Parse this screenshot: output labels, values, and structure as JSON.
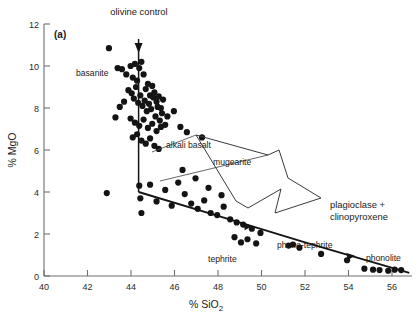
{
  "figure": {
    "panel_label": "(a)",
    "background": "#ffffff",
    "point_color": "#141414",
    "axis_color": "#6f6f6f"
  },
  "chart_data": {
    "type": "scatter",
    "title": "",
    "xlabel": "% SiO2",
    "xlabel_main": "% SiO",
    "xlabel_sub": "2",
    "ylabel": "% MgO",
    "xlim": [
      40,
      57
    ],
    "ylim": [
      0,
      12
    ],
    "xticks": [
      40,
      42,
      44,
      46,
      48,
      50,
      52,
      54,
      56
    ],
    "yticks": [
      0,
      2,
      4,
      6,
      8,
      10,
      12
    ],
    "grid": false,
    "legend": "none",
    "x": [
      43.0,
      43.4,
      43.6,
      43.8,
      44.0,
      44.1,
      44.2,
      44.3,
      44.4,
      44.5,
      44.6,
      44.7,
      44.8,
      44.9,
      45.0,
      45.1,
      45.2,
      45.3,
      45.4,
      45.5,
      43.9,
      44.05,
      44.15,
      44.25,
      44.35,
      44.45,
      44.55,
      44.65,
      44.75,
      44.85,
      44.95,
      45.05,
      45.15,
      45.25,
      45.35,
      45.45,
      45.6,
      45.7,
      43.7,
      43.5,
      44.0,
      44.2,
      44.4,
      44.6,
      44.8,
      45.0,
      45.2,
      45.4,
      44.1,
      44.3,
      44.5,
      44.7,
      44.9,
      45.1,
      45.3,
      43.3,
      46.0,
      46.3,
      46.6,
      47.3,
      42.9,
      44.4,
      44.45,
      44.5,
      44.9,
      45.2,
      45.6,
      45.9,
      46.2,
      46.5,
      46.8,
      47.1,
      47.4,
      47.7,
      48.0,
      48.3,
      48.6,
      48.9,
      49.2,
      49.6,
      50.0,
      48.8,
      49.1,
      49.4,
      49.8,
      51.3,
      51.5,
      51.8,
      52.8,
      54.0,
      54.8,
      55.2,
      55.5,
      55.9,
      56.2,
      56.5,
      46.4,
      47.0,
      47.6,
      48.2
    ],
    "y": [
      10.85,
      9.9,
      9.85,
      9.6,
      10.0,
      9.45,
      10.1,
      9.3,
      9.9,
      10.2,
      9.6,
      8.9,
      9.15,
      8.6,
      9.05,
      8.75,
      8.3,
      8.55,
      8.0,
      8.4,
      8.85,
      8.7,
      8.45,
      9.0,
      8.25,
      8.6,
      8.1,
      8.35,
      7.85,
      8.2,
      7.95,
      8.5,
      7.6,
      8.05,
      7.4,
      7.75,
      7.2,
      7.6,
      8.3,
      8.05,
      7.5,
      7.3,
      7.15,
      7.45,
      7.05,
      7.25,
      6.9,
      7.1,
      6.6,
      6.75,
      6.45,
      6.3,
      6.55,
      6.2,
      6.05,
      7.55,
      7.85,
      7.1,
      6.85,
      6.6,
      3.95,
      4.3,
      3.7,
      3.0,
      4.35,
      3.55,
      4.1,
      3.35,
      4.45,
      3.9,
      3.45,
      3.2,
      3.6,
      3.0,
      2.9,
      3.3,
      2.7,
      2.55,
      2.45,
      2.25,
      2.05,
      1.85,
      1.6,
      1.75,
      1.55,
      1.45,
      1.5,
      1.35,
      1.05,
      0.75,
      0.35,
      0.3,
      0.28,
      0.25,
      0.3,
      0.28,
      5.05,
      4.65,
      4.2,
      3.85,
      0,
      0,
      0,
      0
    ],
    "trend_line": {
      "label": "liquid-line-of-descent",
      "points": [
        [
          44.3,
          4.0
        ],
        [
          48.0,
          2.85
        ],
        [
          52.0,
          1.6
        ],
        [
          56.8,
          0.15
        ]
      ]
    },
    "olivine_control_line": {
      "label": "olivine control",
      "points": [
        [
          44.35,
          11.3
        ],
        [
          44.35,
          4.0
        ]
      ]
    },
    "annotations": [
      {
        "name": "olivine-control",
        "text": "olivine control",
        "x": 44.5,
        "y": 12.6
      },
      {
        "name": "basanite",
        "text": "basanite",
        "x": 41.9,
        "y": 9.05
      },
      {
        "name": "alkali-basalt",
        "text": "alkali basalt",
        "x": 46.0,
        "y": 5.85
      },
      {
        "name": "mugearite",
        "text": "mugearite",
        "x": 48.2,
        "y": 5.1
      },
      {
        "name": "tephrite",
        "text": "tephrite",
        "x": 49.3,
        "y": 0.85
      },
      {
        "name": "phono-tephrite",
        "text": "phono-tephrite",
        "x": 52.3,
        "y": 1.35
      },
      {
        "name": "phonolite",
        "text": "phonolite",
        "x": 55.6,
        "y": 0.85
      },
      {
        "name": "fractionation-arrow",
        "text_line1": "plagioclase +",
        "text_line2": "clinopyroxene",
        "x": 53.2,
        "y": 3.4
      }
    ]
  }
}
